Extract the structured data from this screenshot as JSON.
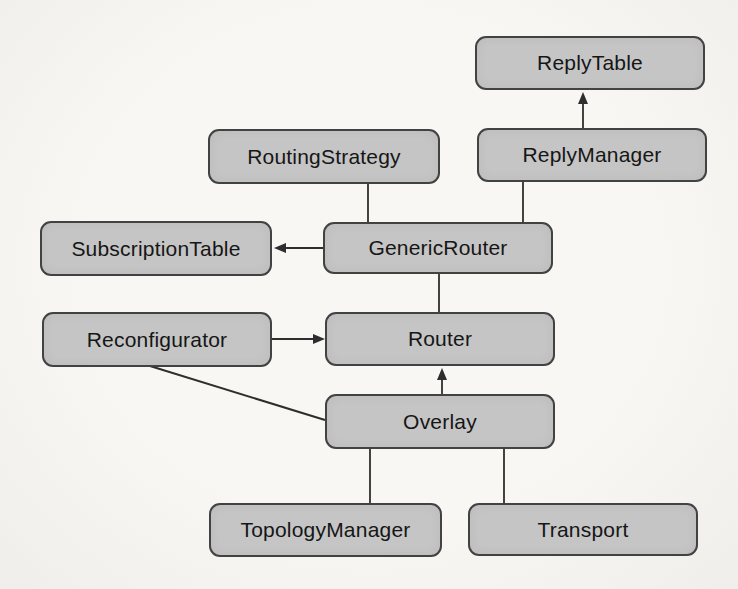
{
  "diagram": {
    "type": "class-dependency-diagram",
    "colors": {
      "node_fill": "#c5c5c5",
      "node_border": "#424242",
      "edge_stroke": "#2e2e2e",
      "background": "#f5f4f1",
      "text": "#161616"
    },
    "nodes": [
      {
        "id": "reply-table",
        "label": "ReplyTable"
      },
      {
        "id": "routing-strategy",
        "label": "RoutingStrategy"
      },
      {
        "id": "reply-manager",
        "label": "ReplyManager"
      },
      {
        "id": "subscription-table",
        "label": "SubscriptionTable"
      },
      {
        "id": "generic-router",
        "label": "GenericRouter"
      },
      {
        "id": "reconfigurator",
        "label": "Reconfigurator"
      },
      {
        "id": "router",
        "label": "Router"
      },
      {
        "id": "overlay",
        "label": "Overlay"
      },
      {
        "id": "topology-manager",
        "label": "TopologyManager"
      },
      {
        "id": "transport",
        "label": "Transport"
      }
    ],
    "edges": [
      {
        "from": "ReplyManager",
        "to": "ReplyTable",
        "arrowhead": true,
        "direction": "up"
      },
      {
        "from": "RoutingStrategy",
        "to": "GenericRouter",
        "arrowhead": false,
        "direction": "down"
      },
      {
        "from": "ReplyManager",
        "to": "GenericRouter",
        "arrowhead": false,
        "direction": "down"
      },
      {
        "from": "GenericRouter",
        "to": "SubscriptionTable",
        "arrowhead": true,
        "direction": "left"
      },
      {
        "from": "GenericRouter",
        "to": "Router",
        "arrowhead": false,
        "direction": "down"
      },
      {
        "from": "Reconfigurator",
        "to": "Router",
        "arrowhead": true,
        "direction": "right"
      },
      {
        "from": "Overlay",
        "to": "Router",
        "arrowhead": true,
        "direction": "up"
      },
      {
        "from": "Reconfigurator",
        "to": "Overlay",
        "arrowhead": false,
        "direction": "diagonal"
      },
      {
        "from": "Overlay",
        "to": "TopologyManager",
        "arrowhead": false,
        "direction": "down"
      },
      {
        "from": "Overlay",
        "to": "Transport",
        "arrowhead": false,
        "direction": "down"
      }
    ]
  }
}
